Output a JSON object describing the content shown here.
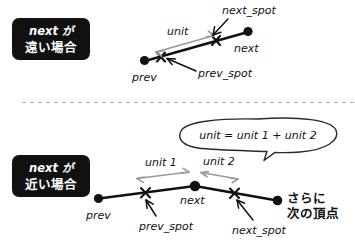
{
  "page": {
    "background": "#ffffff",
    "ink_color": "#111111",
    "accent_gray": "#9a9a9a",
    "badge_bg": "#111111",
    "badge_fg": "#ffffff"
  },
  "divider": {
    "name": "section-divider",
    "style": "dashed",
    "color": "#b8b8b8"
  },
  "sections": {
    "far": {
      "badge": {
        "line1": "next が",
        "line2": "遠い場合"
      },
      "labels": {
        "prev": "prev",
        "next": "next",
        "prev_spot": "prev_spot",
        "next_spot": "next_spot",
        "unit": "unit"
      }
    },
    "near": {
      "badge": {
        "line1": "next が",
        "line2": "近い場合"
      },
      "labels": {
        "prev": "prev",
        "next": "next",
        "prev_spot": "prev_spot",
        "next_spot": "next_spot",
        "unit1": "unit 1",
        "unit2": "unit 2",
        "further1": "さらに",
        "further2": "次の頂点"
      },
      "callout": {
        "text": "unit = unit 1 + unit 2"
      }
    }
  }
}
